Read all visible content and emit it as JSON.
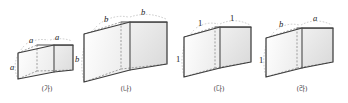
{
  "page": {
    "background_color": "#ffffff",
    "width": 348,
    "height": 103
  },
  "style": {
    "edge_color": "#4a4a4a",
    "hidden_edge_color": "#8f8f8f",
    "guide_color": "#b4b4b4",
    "face_front_color": "#f7f7f7",
    "face_top_color": "#fdfdfd",
    "face_side_color": "#e9e9e9",
    "label_color": "#1a1a1a",
    "caption_color": "#3a3a3a"
  },
  "figures": [
    {
      "id": "figure-a",
      "caption": "(가)",
      "labels": [
        {
          "name": "top-left-edge-label",
          "text": "a"
        },
        {
          "name": "top-back-edge-label",
          "text": "a"
        },
        {
          "name": "front-left-vertical-edge-label",
          "text": "a"
        }
      ],
      "shape": "cube",
      "relative_size": "small"
    },
    {
      "id": "figure-b",
      "caption": "(나)",
      "labels": [
        {
          "name": "top-left-edge-label",
          "text": "b"
        },
        {
          "name": "top-back-edge-label",
          "text": "b"
        },
        {
          "name": "front-left-vertical-edge-label",
          "text": "b"
        }
      ],
      "shape": "cube",
      "relative_size": "large"
    },
    {
      "id": "figure-c",
      "caption": "(다)",
      "labels": [
        {
          "name": "top-left-edge-label",
          "text": "1"
        },
        {
          "name": "top-back-edge-label",
          "text": "1"
        },
        {
          "name": "front-left-vertical-edge-label",
          "text": "1"
        }
      ],
      "shape": "cuboid",
      "relative_size": "medium"
    },
    {
      "id": "figure-d",
      "caption": "(라)",
      "labels": [
        {
          "name": "top-left-edge-label",
          "text": "b"
        },
        {
          "name": "top-back-edge-label",
          "text": "a"
        },
        {
          "name": "front-left-vertical-edge-label",
          "text": "1"
        }
      ],
      "shape": "cuboid",
      "relative_size": "medium"
    }
  ]
}
